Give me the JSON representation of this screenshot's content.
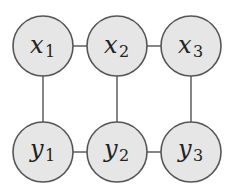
{
  "diagram": {
    "type": "grid-graph",
    "node_fill": "#e6e6e6",
    "node_stroke": "#555555",
    "edge_color": "#444444",
    "nodes": [
      {
        "id": "x1",
        "base": "x",
        "sub": "1"
      },
      {
        "id": "x2",
        "base": "x",
        "sub": "2"
      },
      {
        "id": "x3",
        "base": "x",
        "sub": "3"
      },
      {
        "id": "y1",
        "base": "y",
        "sub": "1"
      },
      {
        "id": "y2",
        "base": "y",
        "sub": "2"
      },
      {
        "id": "y3",
        "base": "y",
        "sub": "3"
      }
    ],
    "edges": [
      [
        "x1",
        "x2"
      ],
      [
        "x2",
        "x3"
      ],
      [
        "y1",
        "y2"
      ],
      [
        "y2",
        "y3"
      ],
      [
        "x1",
        "y1"
      ],
      [
        "x2",
        "y2"
      ],
      [
        "x3",
        "y3"
      ]
    ]
  }
}
